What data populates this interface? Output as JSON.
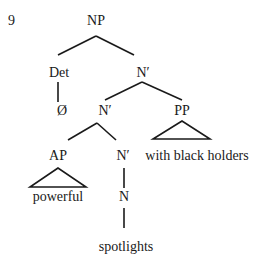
{
  "example_number": "9",
  "tree": {
    "root": "NP",
    "det": "Det",
    "det_child": "Ø",
    "nbar_top": "N′",
    "nbar_mid": "N′",
    "pp": "PP",
    "pp_text": "with black holders",
    "ap": "AP",
    "ap_text": "powerful",
    "nbar_low": "N′",
    "n": "N",
    "n_text": "spotlights"
  }
}
